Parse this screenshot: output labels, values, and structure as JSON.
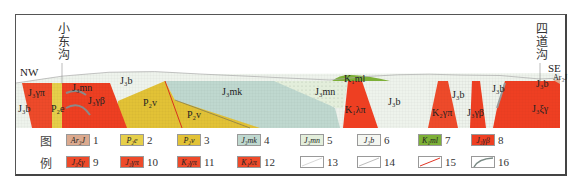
{
  "diagram": {
    "type": "geological-cross-section",
    "orientation": {
      "left": "NW",
      "right": "SE"
    },
    "place_names": [
      {
        "name": "小东沟",
        "position": "left"
      },
      {
        "name": "四道沟",
        "position": "right"
      }
    ],
    "unit_labels": {
      "j1b_left": "J₃b",
      "j3ypi": "J₃γπ",
      "p2e": "P₂e",
      "j3mn_left": "J₃mn",
      "j3gb": "J₃γβ",
      "j3b_top": "J₃b",
      "p2v_1": "P₂v",
      "p2v_2": "P₂v",
      "j3mk": "J₃mk",
      "j3mn_mid": "J₃mn",
      "k1ml": "K₁ml",
      "k1lam": "K₁λπ",
      "j3b_mid": "J₃b",
      "k2gpi": "K₂γπ",
      "j3b_v1": "J₃b",
      "j3b_v2": "J₃b",
      "j3gb_right": "J₃γβ",
      "j3b_right": "J₃b",
      "j3xg": "J₃ξγ",
      "ar3j": "Ar₃J"
    },
    "colors": {
      "red": "#ee3f22",
      "yellow": "#e6c639",
      "teal": "#bfd8cf",
      "pale": "#edf2ea",
      "green": "#7db037",
      "tan": "#dba98e",
      "grey_dyke": "#8a8a8a"
    }
  },
  "legend": {
    "title_top": "图",
    "title_bottom": "例",
    "items": [
      {
        "num": "1",
        "code": "Ar₃J",
        "fill": "#dba98e"
      },
      {
        "num": "2",
        "code": "P₂e",
        "fill": "#e6cf4a"
      },
      {
        "num": "3",
        "code": "P₂v",
        "fill": "#e2c236"
      },
      {
        "num": "4",
        "code": "J₃mk",
        "fill": "#bfd8cf"
      },
      {
        "num": "5",
        "code": "J₃mn",
        "fill": "#e3eedb"
      },
      {
        "num": "6",
        "code": "J₃b",
        "fill": "#f4f6f1"
      },
      {
        "num": "7",
        "code": "K₁ml",
        "fill": "#7db037"
      },
      {
        "num": "8",
        "code": "J₃γβ",
        "fill": "#ee3f22"
      },
      {
        "num": "9",
        "code": "J₃ξγ",
        "fill": "#ee4a2a"
      },
      {
        "num": "10",
        "code": "J₃γπ",
        "fill": "#ee4a2a"
      },
      {
        "num": "11",
        "code": "K₂γπ",
        "fill": "#ee4a2a"
      },
      {
        "num": "12",
        "code": "K₁λπ",
        "fill": "#ee4a2a"
      },
      {
        "num": "13",
        "code": "",
        "fill": "#ffffff",
        "line": "geological-boundary"
      },
      {
        "num": "14",
        "code": "",
        "fill": "#ffffff",
        "line": "unconformity"
      },
      {
        "num": "15",
        "code": "",
        "fill": "#ffffff",
        "line": "fault"
      },
      {
        "num": "16",
        "code": "",
        "fill": "#ffffff",
        "line": "ore-body"
      }
    ]
  }
}
